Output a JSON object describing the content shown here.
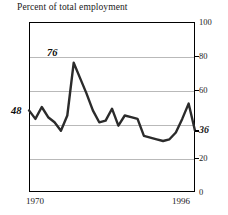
{
  "chart_data": {
    "type": "line",
    "title": "Percent of total employment",
    "xlabel": "",
    "ylabel": "",
    "xlim": [
      1970,
      1996
    ],
    "ylim": [
      0,
      100
    ],
    "grid": true,
    "legend": "none",
    "y_ticks": [
      {
        "value": 100,
        "label": "100",
        "emphasis": false
      },
      {
        "value": 80,
        "label": "80",
        "emphasis": false
      },
      {
        "value": 60,
        "label": "60",
        "emphasis": false
      },
      {
        "value": 36,
        "label": "36",
        "emphasis": true
      },
      {
        "value": 20,
        "label": "20",
        "emphasis": false
      },
      {
        "value": 0,
        "label": "0",
        "emphasis": false
      }
    ],
    "gridline_values": [
      80,
      60,
      40,
      20
    ],
    "x_ticks": [
      {
        "value": 1970,
        "label": "1970"
      },
      {
        "value": 1996,
        "label": "1996"
      }
    ],
    "annotations": [
      {
        "name": "start-value",
        "text": "48",
        "x": 1970,
        "y": 48
      },
      {
        "name": "peak-value",
        "text": "76",
        "x": 1974,
        "y": 76
      }
    ],
    "series": [
      {
        "name": "percent-of-total-employment",
        "color": "#2b2b2b",
        "x": [
          1970,
          1971,
          1972,
          1973,
          1974,
          1975,
          1976,
          1977,
          1978,
          1979,
          1980,
          1981,
          1982,
          1983,
          1984,
          1985,
          1986,
          1987,
          1988,
          1989,
          1990,
          1991,
          1992,
          1993,
          1994,
          1995,
          1996
        ],
        "values": [
          48,
          43,
          50,
          44,
          41,
          36,
          45,
          76,
          67,
          58,
          48,
          41,
          42,
          49,
          39,
          45,
          44,
          43,
          33,
          32,
          31,
          30,
          31,
          35,
          43,
          52,
          36
        ]
      }
    ]
  }
}
